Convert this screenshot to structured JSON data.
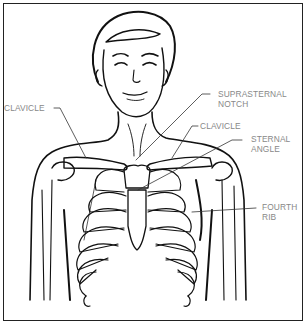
{
  "figure": {
    "labels": {
      "clavicle_left": "CLAVICLE",
      "suprasternal_notch": [
        "SUPRASTERNAL",
        "NOTCH"
      ],
      "clavicle_right": "CLAVICLE",
      "sternal_angle": [
        "STERNAL",
        "ANGLE"
      ],
      "fourth_rib": [
        "FOURTH",
        "RIB"
      ]
    },
    "colors": {
      "line": "#111111",
      "label_text": "#888888",
      "leader_line": "#333333",
      "border": "#222222"
    }
  }
}
